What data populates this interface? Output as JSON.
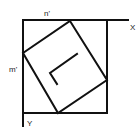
{
  "diagram": {
    "labels": {
      "top_n": "n'",
      "left_m": "m'",
      "x_axis": "X",
      "y_axis": "Y"
    },
    "colors": {
      "stroke": "#111111",
      "background": "#ffffff"
    }
  }
}
